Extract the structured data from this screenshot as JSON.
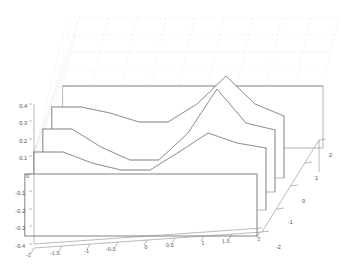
{
  "chart_data": {
    "type": "line",
    "render_style": "waterfall-3d-mesh",
    "title": "",
    "subtitle": "",
    "xlabel": "",
    "ylabel": "",
    "zlabel": "",
    "xlim": [
      -2,
      2
    ],
    "ylim": [
      -2,
      2
    ],
    "zlim": [
      -0.4,
      0.4
    ],
    "xticks": [
      -2,
      -1.5,
      -1,
      -0.5,
      0,
      0.5,
      1,
      1.5,
      2
    ],
    "xticklabels": [
      "-2",
      "-1.5",
      "-1",
      "-0.5",
      "0",
      "0.5",
      "1",
      "1.5",
      "2"
    ],
    "yticks": [
      -2,
      -1,
      0,
      1,
      2
    ],
    "yticklabels": [
      "-2",
      "-1",
      "0",
      "1",
      "2"
    ],
    "zticks": [
      -0.4,
      -0.3,
      -0.2,
      -0.1,
      0,
      0.1,
      0.2,
      0.3,
      0.4
    ],
    "zticklabels": [
      "-0.4",
      "-0.3",
      "-0.2",
      "-0.1",
      "0",
      "0.1",
      "0.2",
      "0.3",
      "0.4"
    ],
    "grid": true,
    "grid_style": "dotted",
    "legend": null,
    "legend_position": "none",
    "x": [
      -2,
      -1.5,
      -1,
      -0.5,
      0,
      0.5,
      1,
      1.5,
      2
    ],
    "series": [
      {
        "name": "y = 2",
        "y": 2,
        "values": [
          0.4,
          0.4,
          0.4,
          0.4,
          0.4,
          0.4,
          0.4,
          0.4,
          0.4
        ]
      },
      {
        "name": "y = 1",
        "y": 1,
        "values": [
          0.31,
          0.31,
          0.28,
          0.24,
          0.24,
          0.33,
          0.47,
          0.33,
          0.27
        ]
      },
      {
        "name": "y = 0",
        "y": 0,
        "values": [
          0.18,
          0.18,
          0.08,
          0.01,
          0.01,
          0.16,
          0.41,
          0.22,
          0.18
        ]
      },
      {
        "name": "y = -1",
        "y": -1,
        "values": [
          0.1,
          0.1,
          0.04,
          0.0,
          0.0,
          0.1,
          0.21,
          0.15,
          0.12
        ]
      },
      {
        "name": "y = -2",
        "y": -2,
        "values": [
          0.0,
          0.0,
          0.0,
          0.0,
          0.0,
          0.0,
          0.0,
          0.0,
          0.0
        ]
      }
    ],
    "baseline": -0.4,
    "colors": {
      "mesh": "#7a7a7a",
      "axis": "#8c8c8c",
      "grid": "#d8d8d8",
      "text": "#4d4d4d",
      "background": "#ffffff"
    }
  },
  "axes": {
    "x": {
      "name": "x-axis",
      "ticks": [
        {
          "label": "-2",
          "tx": 29,
          "ty": 257,
          "mx": 34,
          "my": 248
        },
        {
          "label": "-1.5",
          "tx": 55,
          "ty": 255,
          "mx": 62,
          "my": 246
        },
        {
          "label": "-1",
          "tx": 87,
          "ty": 253,
          "mx": 90,
          "my": 244
        },
        {
          "label": "-0.5",
          "tx": 111,
          "ty": 251,
          "mx": 118,
          "my": 242
        },
        {
          "label": "0",
          "tx": 146,
          "ty": 249,
          "mx": 147,
          "my": 240
        },
        {
          "label": "0.5",
          "tx": 170,
          "ty": 247,
          "mx": 175,
          "my": 238
        },
        {
          "label": "1",
          "tx": 203,
          "ty": 245,
          "mx": 204,
          "my": 236
        },
        {
          "label": "1.5",
          "tx": 226,
          "ty": 243,
          "mx": 232,
          "my": 234
        },
        {
          "label": "2",
          "tx": 259,
          "ty": 241,
          "mx": 260,
          "my": 232
        }
      ]
    },
    "y": {
      "name": "y-axis-depth",
      "ticks": [
        {
          "label": "-2",
          "tx": 276,
          "ty": 249,
          "mx": 262,
          "my": 232
        },
        {
          "label": "-1",
          "tx": 288,
          "ty": 224,
          "mx": 277,
          "my": 209
        },
        {
          "label": "0",
          "tx": 302,
          "ty": 203,
          "mx": 291,
          "my": 186
        },
        {
          "label": "1",
          "tx": 315,
          "ty": 180,
          "mx": 305,
          "my": 163
        },
        {
          "label": "2",
          "tx": 329,
          "ty": 157,
          "mx": 319,
          "my": 140
        }
      ]
    },
    "z": {
      "name": "z-axis-vertical",
      "ticks": [
        {
          "label": "0.4",
          "tx": 27,
          "ty": 106,
          "mx": 32,
          "my": 104
        },
        {
          "label": "0.3",
          "tx": 27,
          "ty": 123,
          "mx": 32,
          "my": 121
        },
        {
          "label": "0.2",
          "tx": 27,
          "ty": 141,
          "mx": 32,
          "my": 139
        },
        {
          "label": "0.1",
          "tx": 27,
          "ty": 158,
          "mx": 32,
          "my": 156
        },
        {
          "label": "0",
          "tx": 29,
          "ty": 176,
          "mx": 32,
          "my": 174
        },
        {
          "label": "-0.1",
          "tx": 25,
          "ty": 193,
          "mx": 32,
          "my": 191
        },
        {
          "label": "-0.2",
          "tx": 25,
          "ty": 211,
          "mx": 32,
          "my": 209
        },
        {
          "label": "-0.3",
          "tx": 25,
          "ty": 228,
          "mx": 32,
          "my": 226
        },
        {
          "label": "-0.4",
          "tx": 25,
          "ty": 246,
          "mx": 32,
          "my": 244
        }
      ]
    }
  }
}
